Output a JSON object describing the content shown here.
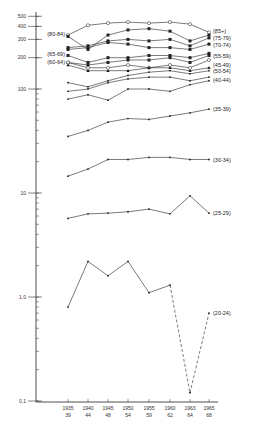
{
  "chart_data": {
    "type": "line",
    "title": "",
    "xlabel": "",
    "ylabel": "",
    "yscale": "log",
    "ylim": [
      0.1,
      500
    ],
    "grid": false,
    "legend_position": "inline labels at line ends",
    "categories": [
      "1935 39",
      "1940 44",
      "1945 48",
      "1950 54",
      "1955 59",
      "1960 62",
      "1963 64",
      "1965 68"
    ],
    "x_tick_labels": [
      {
        "top": "1935",
        "bottom": "39"
      },
      {
        "top": "1940",
        "bottom": "44"
      },
      {
        "top": "1945",
        "bottom": "48"
      },
      {
        "top": "1950",
        "bottom": "54"
      },
      {
        "top": "1955",
        "bottom": "59"
      },
      {
        "top": "1960",
        "bottom": "62"
      },
      {
        "top": "1963",
        "bottom": "64"
      },
      {
        "top": "1965",
        "bottom": "68"
      }
    ],
    "y_tick_labels": [
      "500",
      "400",
      "300",
      "200",
      "100",
      "10",
      "1,0",
      "0,1"
    ],
    "y_tick_values": [
      500,
      400,
      300,
      200,
      100,
      10,
      1,
      0.1
    ],
    "series": [
      {
        "name": "(85+)",
        "label_side": "right",
        "marker": "open-circle",
        "values": [
          330,
          410,
          430,
          440,
          430,
          440,
          420,
          350
        ]
      },
      {
        "name": "(80-84)",
        "label_side": "left",
        "marker": "filled-square",
        "values": [
          320,
          240,
          330,
          370,
          380,
          360,
          290,
          330
        ]
      },
      {
        "name": "(75-79)",
        "label_side": "right",
        "marker": "filled-square",
        "values": [
          250,
          260,
          290,
          300,
          290,
          300,
          260,
          310
        ]
      },
      {
        "name": "(70-74)",
        "label_side": "right",
        "marker": "filled-square",
        "values": [
          240,
          250,
          280,
          270,
          250,
          250,
          240,
          270
        ]
      },
      {
        "name": "(65-69)",
        "label_side": "left",
        "marker": "filled-square",
        "values": [
          210,
          180,
          200,
          200,
          210,
          210,
          200,
          220
        ]
      },
      {
        "name": "(55-59)",
        "label_side": "right",
        "marker": "filled-square",
        "values": [
          180,
          170,
          180,
          190,
          190,
          200,
          180,
          210
        ]
      },
      {
        "name": "(60-64)",
        "label_side": "left",
        "marker": "open-circle",
        "values": [
          180,
          160,
          160,
          170,
          160,
          170,
          160,
          190
        ]
      },
      {
        "name": "(45-49)",
        "label_side": "right",
        "marker": "filled-triangle",
        "values": [
          170,
          150,
          150,
          150,
          160,
          160,
          150,
          160
        ]
      },
      {
        "name": "(50-54)",
        "label_side": "right",
        "marker": "filled-dot",
        "values": [
          115,
          105,
          120,
          135,
          145,
          150,
          140,
          150
        ]
      },
      {
        "name": "(40-44)",
        "label_side": "right",
        "marker": "filled-dot",
        "values": [
          95,
          100,
          115,
          125,
          130,
          130,
          120,
          130
        ]
      },
      {
        "name": "(35-39)",
        "label_side": "right",
        "marker": "filled-dot",
        "values": [
          80,
          88,
          78,
          100,
          100,
          95,
          110,
          120
        ]
      },
      {
        "name": "(35-39) lower",
        "label_side": "right",
        "marker": "filled-dot",
        "values": [
          35,
          40,
          48,
          52,
          51,
          55,
          59,
          64
        ]
      },
      {
        "name": "(30-34)",
        "label_side": "right",
        "marker": "filled-dot",
        "values": [
          14.5,
          17,
          21,
          21,
          22,
          22,
          21,
          21
        ]
      },
      {
        "name": "(25-29)",
        "label_side": "right",
        "marker": "filled-dot",
        "values": [
          5.7,
          6.3,
          6.4,
          6.6,
          7.0,
          6.3,
          9.4,
          6.4
        ]
      },
      {
        "name": "(20-24)",
        "label_side": "right",
        "marker": "filled-dot",
        "dashed_from_index": 5,
        "values": [
          0.8,
          2.2,
          1.6,
          2.2,
          1.1,
          1.3,
          0.12,
          0.7
        ]
      }
    ],
    "line_labels": {
      "right": [
        "(85+)",
        "(75-79)",
        "(70-74)",
        "(55-59)",
        "(45-49)",
        "(50-54)",
        "(40-44)",
        "(35-39)",
        "(30-34)",
        "(25-29)",
        "(20-24)"
      ],
      "left": [
        "(80-84)",
        "(65-69)",
        "(60-64)"
      ]
    }
  }
}
